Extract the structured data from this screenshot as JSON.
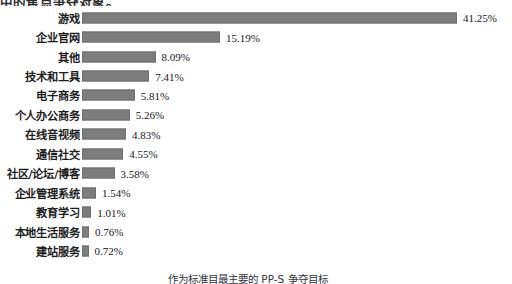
{
  "title_clipped": "中的焦点争夺对象。",
  "footnote_clipped": "作为标准目最主要的 PP-S 争夺目标",
  "style": {
    "bar_color": "#7d7d7d",
    "background_color": "#ffffff",
    "text_color": "#1d1d1d"
  },
  "chart_data": {
    "type": "bar",
    "orientation": "horizontal",
    "title": "中的焦点争夺对象。",
    "xlabel": "",
    "ylabel": "",
    "grid": false,
    "legend": null,
    "value_suffix": "%",
    "xlim": [
      0,
      41.25
    ],
    "categories": [
      "游戏",
      "企业官网",
      "其他",
      "技术和工具",
      "电子商务",
      "个人办公商务",
      "在线音视频",
      "通信社交",
      "社区/论坛/博客",
      "企业管理系统",
      "教育学习",
      "本地生活服务",
      "建站服务"
    ],
    "values": [
      41.25,
      15.19,
      8.09,
      7.41,
      5.81,
      5.26,
      4.83,
      4.55,
      3.58,
      1.54,
      1.01,
      0.76,
      0.72
    ],
    "labels": [
      "41.25%",
      "15.19%",
      "8.09%",
      "7.41%",
      "5.81%",
      "5.26%",
      "4.83%",
      "4.55%",
      "3.58%",
      "1.54%",
      "1.01%",
      "0.76%",
      "0.72%"
    ]
  }
}
